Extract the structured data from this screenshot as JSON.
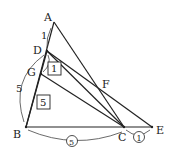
{
  "points": {
    "A": {
      "label": "A",
      "x": 54,
      "y": 22
    },
    "D": {
      "label": "D",
      "x": 47,
      "y": 51
    },
    "G": {
      "label": "G",
      "x": 41,
      "y": 74
    },
    "B": {
      "label": "B",
      "x": 26,
      "y": 127
    },
    "C": {
      "label": "C",
      "x": 124,
      "y": 127
    },
    "E": {
      "label": "E",
      "x": 152,
      "y": 127
    },
    "F": {
      "label": "F",
      "x": 100,
      "y": 88
    }
  },
  "labels": {
    "AD": "1",
    "DB_arc": "5",
    "box_DG": "1",
    "box_GB": "5",
    "BC_circled": "5",
    "CE_circled": "1"
  }
}
